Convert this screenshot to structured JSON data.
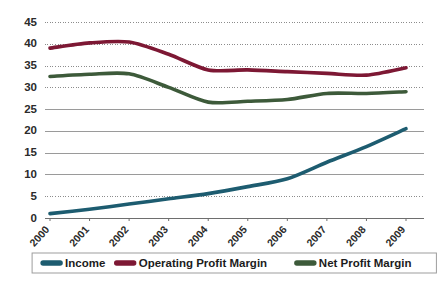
{
  "chart_data": {
    "type": "line",
    "title": "",
    "subtitle": "",
    "xlabel": "",
    "ylabel": "",
    "categories": [
      "2000",
      "2001",
      "2002",
      "2003",
      "2004",
      "2005",
      "2006",
      "2007",
      "2008",
      "2009"
    ],
    "x": [
      2000,
      2001,
      2002,
      2003,
      2004,
      2005,
      2006,
      2007,
      2008,
      2009
    ],
    "ylim": [
      0,
      45
    ],
    "ytick_values": [
      0,
      5,
      10,
      15,
      20,
      25,
      30,
      35,
      40,
      45
    ],
    "ytick_labels": [
      "0",
      "5",
      "10",
      "15",
      "20",
      "25",
      "30",
      "35",
      "40",
      "45"
    ],
    "grid": true,
    "grid_axis": "y",
    "legend_position": "bottom",
    "series": [
      {
        "name": "Income",
        "color": "#1d5c70",
        "values": [
          1.0,
          2.0,
          3.2,
          4.4,
          5.6,
          7.2,
          9.0,
          12.8,
          16.4,
          20.5
        ]
      },
      {
        "name": "Operating Profit Margin",
        "color": "#7d1834",
        "values": [
          39.0,
          40.2,
          40.4,
          37.6,
          34.0,
          34.0,
          33.6,
          33.2,
          32.8,
          34.5
        ]
      },
      {
        "name": "Net Profit Margin",
        "color": "#3d5a3a",
        "values": [
          32.5,
          33.0,
          33.1,
          30.0,
          26.6,
          26.8,
          27.2,
          28.6,
          28.6,
          29.0
        ]
      }
    ]
  },
  "legend": {
    "entries": [
      {
        "label": "Income",
        "color": "#1d5c70"
      },
      {
        "label": "Operating Profit Margin",
        "color": "#7d1834"
      },
      {
        "label": "Net Profit Margin",
        "color": "#3d5a3a"
      }
    ]
  },
  "colors": {
    "income": "#1d5c70",
    "operating_profit_margin": "#7d1834",
    "net_profit_margin": "#3d5a3a",
    "grid": "#8c8c8c",
    "axis": "#6e6e6e",
    "background": "#ffffff",
    "text": "#2b2b2b"
  }
}
